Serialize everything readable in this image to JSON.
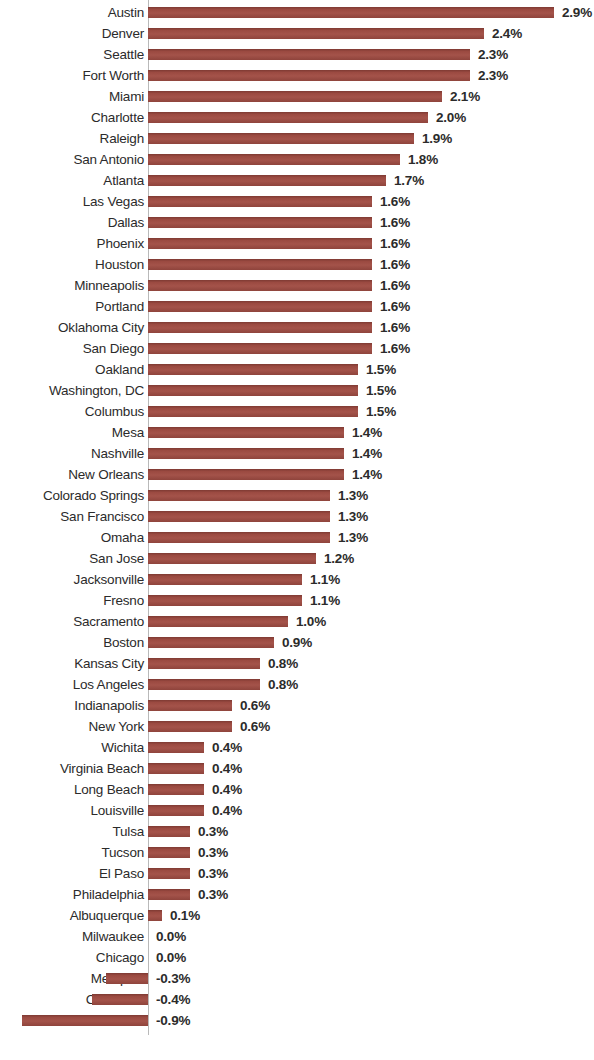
{
  "chart_data": {
    "type": "bar",
    "orientation": "horizontal",
    "title": "",
    "subtitle": "",
    "xlabel": "",
    "ylabel": "",
    "grid": false,
    "legend": null,
    "value_format": "percent_one_decimal",
    "xlim": [
      -0.9,
      2.9
    ],
    "categories": [
      "Austin",
      "Denver",
      "Seattle",
      "Fort Worth",
      "Miami",
      "Charlotte",
      "Raleigh",
      "San Antonio",
      "Atlanta",
      "Las Vegas",
      "Dallas",
      "Phoenix",
      "Houston",
      "Minneapolis",
      "Portland",
      "Oklahoma City",
      "San Diego",
      "Oakland",
      "Washington, DC",
      "Columbus",
      "Mesa",
      "Nashville",
      "New Orleans",
      "Colorado Springs",
      "San Francisco",
      "Omaha",
      "San Jose",
      "Jacksonville",
      "Fresno",
      "Sacramento",
      "Boston",
      "Kansas City",
      "Los Angeles",
      "Indianapolis",
      "New York",
      "Wichita",
      "Virginia Beach",
      "Long Beach",
      "Louisville",
      "Tulsa",
      "Tucson",
      "El Paso",
      "Philadelphia",
      "Albuquerque",
      "Milwaukee",
      "Chicago",
      "Memphis",
      "Cleveland",
      "Detroit"
    ],
    "values": [
      2.9,
      2.4,
      2.3,
      2.3,
      2.1,
      2.0,
      1.9,
      1.8,
      1.7,
      1.6,
      1.6,
      1.6,
      1.6,
      1.6,
      1.6,
      1.6,
      1.6,
      1.5,
      1.5,
      1.5,
      1.4,
      1.4,
      1.4,
      1.3,
      1.3,
      1.3,
      1.2,
      1.1,
      1.1,
      1.0,
      0.9,
      0.8,
      0.8,
      0.6,
      0.6,
      0.4,
      0.4,
      0.4,
      0.4,
      0.3,
      0.3,
      0.3,
      0.3,
      0.1,
      0.0,
      0.0,
      -0.3,
      -0.4,
      -0.9
    ],
    "value_labels": [
      "2.9%",
      "2.4%",
      "2.3%",
      "2.3%",
      "2.1%",
      "2.0%",
      "1.9%",
      "1.8%",
      "1.7%",
      "1.6%",
      "1.6%",
      "1.6%",
      "1.6%",
      "1.6%",
      "1.6%",
      "1.6%",
      "1.6%",
      "1.5%",
      "1.5%",
      "1.5%",
      "1.4%",
      "1.4%",
      "1.4%",
      "1.3%",
      "1.3%",
      "1.3%",
      "1.2%",
      "1.1%",
      "1.1%",
      "1.0%",
      "0.9%",
      "0.8%",
      "0.8%",
      "0.6%",
      "0.6%",
      "0.4%",
      "0.4%",
      "0.4%",
      "0.4%",
      "0.3%",
      "0.3%",
      "0.3%",
      "0.3%",
      "0.1%",
      "0.0%",
      "0.0%",
      "-0.3%",
      "-0.4%",
      "-0.9%"
    ],
    "colors": {
      "bar": "#9b4a41",
      "bar_top_edge": "#7e3a33",
      "text": "#2b2b2b",
      "axis": "#b9b9b9",
      "background": "#ffffff"
    }
  },
  "layout": {
    "axis_x": 148,
    "px_per_unit": 140,
    "row_pitch": 21,
    "row_top_offset": 2,
    "bar_height": 11,
    "label_gap": 8,
    "category_label_right_pad": 152
  }
}
